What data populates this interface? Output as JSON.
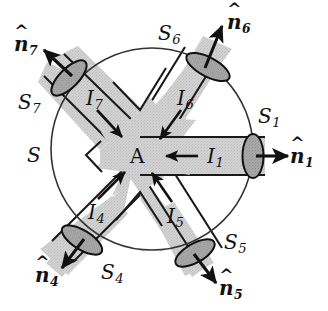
{
  "figure": {
    "name": "junction-control-surface-diagram",
    "colors": {
      "conductor_fill": "#cfcfcf",
      "cap_fill": "#a6a6a6",
      "outline": "#1a1a1a",
      "surface_line": "#3a3a3a",
      "background": "#ffffff",
      "label": "#111111"
    },
    "surface": {
      "label": "S",
      "center": {
        "x": 152,
        "y": 149
      },
      "radius": 101,
      "label_position": {
        "x": 27,
        "y": 155
      }
    },
    "node": {
      "label": "A",
      "position": {
        "x": 137,
        "y": 156
      }
    },
    "arms": [
      {
        "id": "arm-1",
        "surface_label": "S",
        "surface_sub": "1",
        "current_label": "I",
        "current_sub": "1",
        "normal_label": "n",
        "normal_sub": "1",
        "angle_deg": 0,
        "current_direction": "inward",
        "normal_direction": "outward",
        "surface_label_position": {
          "x": 258,
          "y": 116
        },
        "current_label_position": {
          "x": 207,
          "y": 147
        },
        "normal_label_position": {
          "x": 290,
          "y": 148
        }
      },
      {
        "id": "arm-4",
        "surface_label": "S",
        "surface_sub": "4",
        "current_label": "I",
        "current_sub": "4",
        "normal_label": "n",
        "normal_sub": "4",
        "angle_deg": 225,
        "current_direction": "inward",
        "normal_direction": "outward",
        "surface_label_position": {
          "x": 101,
          "y": 264
        },
        "current_label_position": {
          "x": 88,
          "y": 203
        },
        "normal_label_position": {
          "x": 35,
          "y": 265
        }
      },
      {
        "id": "arm-5",
        "surface_label": "S",
        "surface_sub": "5",
        "current_label": "I",
        "current_sub": "5",
        "normal_label": "n",
        "normal_sub": "5",
        "angle_deg": 300,
        "current_direction": "inward",
        "normal_direction": "outward",
        "surface_label_position": {
          "x": 224,
          "y": 234
        },
        "current_label_position": {
          "x": 167,
          "y": 207
        },
        "normal_label_position": {
          "x": 219,
          "y": 278
        }
      },
      {
        "id": "arm-6",
        "surface_label": "S",
        "surface_sub": "6",
        "current_label": "I",
        "current_sub": "6",
        "normal_label": "n",
        "normal_sub": "6",
        "angle_deg": 60,
        "current_direction": "inward",
        "normal_direction": "outward",
        "surface_label_position": {
          "x": 158,
          "y": 25
        },
        "current_label_position": {
          "x": 177,
          "y": 90
        },
        "normal_label_position": {
          "x": 227,
          "y": 10
        }
      },
      {
        "id": "arm-7",
        "surface_label": "S",
        "surface_sub": "7",
        "current_label": "I",
        "current_sub": "7",
        "normal_label": "n",
        "normal_sub": "7",
        "angle_deg": 135,
        "current_direction": "inward",
        "normal_direction": "outward",
        "surface_label_position": {
          "x": 18,
          "y": 94
        },
        "current_label_position": {
          "x": 86,
          "y": 90
        },
        "normal_label_position": {
          "x": 14,
          "y": 32
        }
      }
    ],
    "hat_glyph": "^"
  }
}
